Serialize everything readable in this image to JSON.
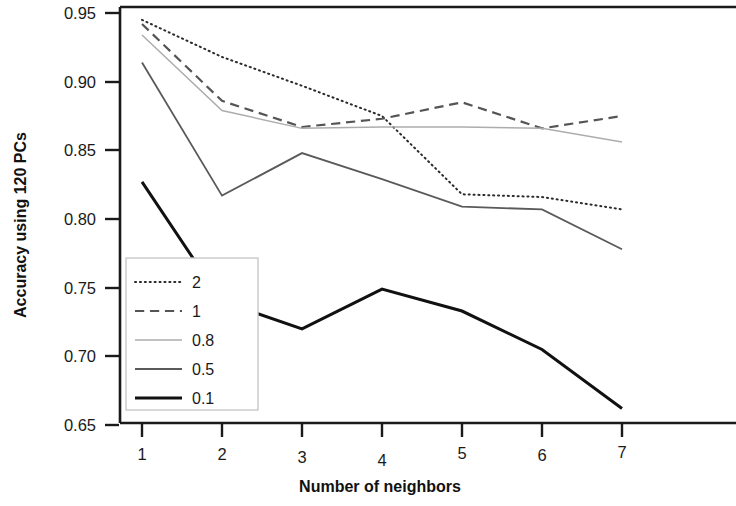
{
  "chart_data": {
    "type": "line",
    "title": "",
    "xlabel": "Number of neighbors",
    "ylabel": "Accuracy using 120 PCs",
    "x": [
      1,
      2,
      3,
      4,
      5,
      6,
      7
    ],
    "xticklabels": [
      "1",
      "2",
      "3",
      "4",
      "5",
      "6",
      "7"
    ],
    "yticklabels": [
      "0.95",
      "0.90",
      "0.85",
      "0.80",
      "0.75",
      "0.70",
      "0.65"
    ],
    "yticks": [
      0.95,
      0.9,
      0.85,
      0.8,
      0.75,
      0.7,
      0.65
    ],
    "xlim": [
      0.7,
      7.3
    ],
    "ylim": [
      0.638,
      0.957
    ],
    "grid": false,
    "legend_position": "lower left",
    "legend_title": "",
    "series": [
      {
        "name": "2",
        "style": "dotted",
        "color": "#2b2b2b",
        "width": 2.0,
        "values": [
          0.945,
          0.918,
          0.897,
          0.875,
          0.818,
          0.816,
          0.807
        ]
      },
      {
        "name": "1",
        "style": "dashed",
        "color": "#555555",
        "width": 2.2,
        "values": [
          0.942,
          0.886,
          0.867,
          0.873,
          0.885,
          0.866,
          0.875
        ]
      },
      {
        "name": "0.8",
        "style": "solid",
        "color": "#adadad",
        "width": 1.5,
        "values": [
          0.934,
          0.879,
          0.866,
          0.867,
          0.867,
          0.866,
          0.856
        ]
      },
      {
        "name": "0.5",
        "style": "solid",
        "color": "#5a5a5a",
        "width": 1.8,
        "values": [
          0.914,
          0.817,
          0.848,
          0.829,
          0.809,
          0.807,
          0.778
        ]
      },
      {
        "name": "0.1",
        "style": "solid",
        "color": "#111111",
        "width": 3.0,
        "values": [
          0.827,
          0.74,
          0.72,
          0.749,
          0.733,
          0.705,
          0.662
        ]
      }
    ]
  },
  "axes": {
    "frame_color": "#1a1a1a",
    "background": "#ffffff"
  }
}
